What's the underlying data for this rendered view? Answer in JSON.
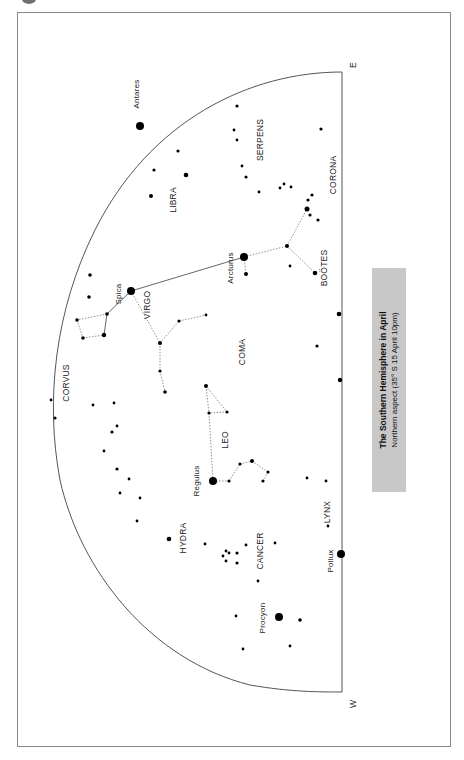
{
  "caption": {
    "title": "The Southern Hemisphere in April",
    "subtitle": "Northern aspect (35° S 15 April 10pm)",
    "background": "#c8c8c8"
  },
  "compass": {
    "east": "E",
    "west": "W"
  },
  "constellations": [
    {
      "name": "SERPENS",
      "x": 263,
      "y": 140
    },
    {
      "name": "CORONA",
      "x": 336,
      "y": 175
    },
    {
      "name": "LIBRA",
      "x": 176,
      "y": 200
    },
    {
      "name": "BOÖTES",
      "x": 327,
      "y": 268
    },
    {
      "name": "VIRGO",
      "x": 150,
      "y": 305
    },
    {
      "name": "CORVUS",
      "x": 69,
      "y": 383
    },
    {
      "name": "COMA",
      "x": 245,
      "y": 352
    },
    {
      "name": "LEO",
      "x": 228,
      "y": 440
    },
    {
      "name": "HYDRA",
      "x": 186,
      "y": 538
    },
    {
      "name": "CANCER",
      "x": 263,
      "y": 551
    },
    {
      "name": "LYNX",
      "x": 330,
      "y": 512
    }
  ],
  "named_stars": [
    {
      "name": "Antares",
      "x": 140,
      "y": 126,
      "label_x": 139,
      "label_y": 94
    },
    {
      "name": "Arcturus",
      "x": 244,
      "y": 257,
      "label_x": 233,
      "label_y": 268
    },
    {
      "name": "Spica",
      "x": 131,
      "y": 291,
      "label_x": 121,
      "label_y": 294
    },
    {
      "name": "Regulus",
      "x": 213,
      "y": 481,
      "label_x": 199,
      "label_y": 481
    },
    {
      "name": "Pollux",
      "x": 341,
      "y": 554,
      "label_x": 333,
      "label_y": 561
    },
    {
      "name": "Procyon",
      "x": 279,
      "y": 617,
      "label_x": 265,
      "label_y": 618
    }
  ],
  "stars": [
    [
      237,
      106,
      1.6
    ],
    [
      234,
      130,
      1.4
    ],
    [
      237,
      140,
      1.4
    ],
    [
      321,
      129,
      1.6
    ],
    [
      242,
      166,
      1.4
    ],
    [
      246,
      177,
      1.6
    ],
    [
      259,
      192,
      1.4
    ],
    [
      280,
      188,
      1.4
    ],
    [
      284,
      184,
      1.4
    ],
    [
      291,
      187,
      1.4
    ],
    [
      312,
      195,
      1.6
    ],
    [
      308,
      200,
      1.6
    ],
    [
      307,
      209,
      2.5
    ],
    [
      310,
      215,
      1.6
    ],
    [
      318,
      220,
      1.6
    ],
    [
      178,
      151,
      1.6
    ],
    [
      154,
      170,
      1.6
    ],
    [
      186,
      175,
      2.3
    ],
    [
      151,
      196,
      2.0
    ],
    [
      287,
      246,
      2.0
    ],
    [
      290,
      266,
      1.4
    ],
    [
      315,
      273,
      2.3
    ],
    [
      246,
      274,
      2.0
    ],
    [
      90,
      275,
      1.8
    ],
    [
      89,
      297,
      1.8
    ],
    [
      107,
      314,
      1.8
    ],
    [
      77,
      320,
      1.8
    ],
    [
      104,
      335,
      2.2
    ],
    [
      83,
      338,
      1.8
    ],
    [
      179,
      321,
      1.6
    ],
    [
      206,
      315,
      1.4
    ],
    [
      160,
      343,
      2.0
    ],
    [
      160,
      371,
      1.6
    ],
    [
      165,
      392,
      1.8
    ],
    [
      206,
      386,
      2.0
    ],
    [
      209,
      413,
      1.6
    ],
    [
      227,
      412,
      1.6
    ],
    [
      317,
      346,
      1.6
    ],
    [
      339,
      314,
      2.3
    ],
    [
      340,
      380,
      2.2
    ],
    [
      51,
      400,
      1.4
    ],
    [
      55,
      418,
      1.6
    ],
    [
      93,
      405,
      1.4
    ],
    [
      114,
      403,
      1.4
    ],
    [
      117,
      426,
      1.4
    ],
    [
      112,
      432,
      1.6
    ],
    [
      104,
      451,
      1.4
    ],
    [
      117,
      469,
      1.6
    ],
    [
      129,
      479,
      1.4
    ],
    [
      120,
      493,
      1.4
    ],
    [
      140,
      498,
      1.4
    ],
    [
      137,
      521,
      1.4
    ],
    [
      169,
      539,
      2.3
    ],
    [
      229,
      481,
      1.6
    ],
    [
      240,
      464,
      1.6
    ],
    [
      252,
      461,
      2.0
    ],
    [
      268,
      472,
      1.6
    ],
    [
      263,
      481,
      1.6
    ],
    [
      307,
      478,
      1.4
    ],
    [
      326,
      481,
      1.4
    ],
    [
      328,
      526,
      1.4
    ],
    [
      205,
      544,
      1.4
    ],
    [
      223,
      556,
      1.4
    ],
    [
      226,
      551,
      1.4
    ],
    [
      229,
      553,
      1.4
    ],
    [
      237,
      553,
      1.6
    ],
    [
      226,
      561,
      1.4
    ],
    [
      237,
      563,
      1.6
    ],
    [
      246,
      545,
      1.4
    ],
    [
      275,
      543,
      1.4
    ],
    [
      258,
      581,
      1.4
    ],
    [
      236,
      616,
      1.4
    ],
    [
      300,
      620,
      1.8
    ],
    [
      290,
      646,
      1.4
    ],
    [
      243,
      649,
      1.4
    ]
  ],
  "solid_lines": [
    [
      [
        131,
        291
      ],
      [
        244,
        257
      ]
    ],
    [
      [
        131,
        291
      ],
      [
        107,
        314
      ]
    ],
    [
      [
        107,
        314
      ],
      [
        104,
        335
      ]
    ]
  ],
  "dashed_lines": [
    [
      [
        244,
        257
      ],
      [
        287,
        246
      ]
    ],
    [
      [
        287,
        246
      ],
      [
        307,
        209
      ]
    ],
    [
      [
        287,
        246
      ],
      [
        315,
        273
      ]
    ],
    [
      [
        244,
        257
      ],
      [
        246,
        274
      ]
    ],
    [
      [
        131,
        291
      ],
      [
        160,
        343
      ]
    ],
    [
      [
        160,
        343
      ],
      [
        179,
        321
      ]
    ],
    [
      [
        179,
        321
      ],
      [
        206,
        315
      ]
    ],
    [
      [
        160,
        343
      ],
      [
        160,
        371
      ]
    ],
    [
      [
        160,
        371
      ],
      [
        165,
        392
      ]
    ],
    [
      [
        107,
        314
      ],
      [
        77,
        320
      ]
    ],
    [
      [
        77,
        320
      ],
      [
        83,
        338
      ]
    ],
    [
      [
        83,
        338
      ],
      [
        104,
        335
      ]
    ],
    [
      [
        206,
        386
      ],
      [
        209,
        413
      ]
    ],
    [
      [
        206,
        386
      ],
      [
        227,
        412
      ]
    ],
    [
      [
        227,
        412
      ],
      [
        209,
        413
      ]
    ],
    [
      [
        209,
        413
      ],
      [
        213,
        481
      ]
    ],
    [
      [
        213,
        481
      ],
      [
        229,
        481
      ]
    ],
    [
      [
        229,
        481
      ],
      [
        240,
        464
      ]
    ],
    [
      [
        240,
        464
      ],
      [
        252,
        461
      ]
    ],
    [
      [
        252,
        461
      ],
      [
        268,
        472
      ]
    ],
    [
      [
        268,
        472
      ],
      [
        263,
        481
      ]
    ]
  ],
  "horizon": {
    "baseline_x": 342,
    "east_y": 72,
    "west_y": 692,
    "arc_path": "M 342 72 C 250 72 150 120 95 230 C 55 310 45 400 60 480 C 80 570 150 660 250 685 C 290 692 320 692 342 692"
  }
}
